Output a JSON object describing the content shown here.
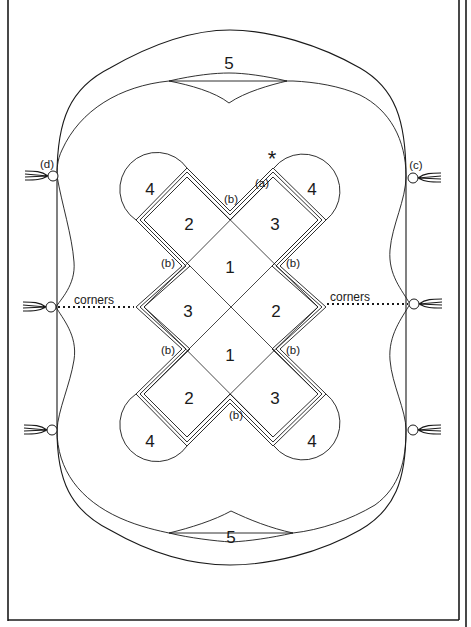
{
  "figure": {
    "type": "sewing/pattern layout diagram",
    "section_numbers": [
      {
        "id": "5-top",
        "text": "5",
        "x": 229,
        "y": 63
      },
      {
        "id": "5-bottom",
        "text": "5",
        "x": 231,
        "y": 537
      },
      {
        "id": "4-top-left",
        "text": "4",
        "x": 150,
        "y": 189
      },
      {
        "id": "4-top-right",
        "text": "4",
        "x": 312,
        "y": 189
      },
      {
        "id": "4-bottom-left",
        "text": "4",
        "x": 150,
        "y": 441
      },
      {
        "id": "4-bottom-right",
        "text": "4",
        "x": 312,
        "y": 441
      },
      {
        "id": "2-top-left",
        "text": "2",
        "x": 189,
        "y": 224
      },
      {
        "id": "3-top-right",
        "text": "3",
        "x": 275,
        "y": 224
      },
      {
        "id": "1-upper",
        "text": "1",
        "x": 230,
        "y": 267
      },
      {
        "id": "3-left",
        "text": "3",
        "x": 188,
        "y": 311
      },
      {
        "id": "2-right",
        "text": "2",
        "x": 276,
        "y": 311
      },
      {
        "id": "1-lower",
        "text": "1",
        "x": 230,
        "y": 355
      },
      {
        "id": "2-bottom-left",
        "text": "2",
        "x": 189,
        "y": 398
      },
      {
        "id": "3-bottom-right",
        "text": "3",
        "x": 275,
        "y": 398
      }
    ],
    "letter_labels": [
      {
        "id": "a",
        "text": "(a)",
        "x": 321,
        "y": 190
      },
      {
        "id": "b-top",
        "text": "(b)",
        "x": 232,
        "y": 208
      },
      {
        "id": "b-left-upper",
        "text": "(b)",
        "x": 166,
        "y": 266
      },
      {
        "id": "b-right-upper",
        "text": "(b)",
        "x": 295,
        "y": 266
      },
      {
        "id": "b-left-lower",
        "text": "(b)",
        "x": 166,
        "y": 354
      },
      {
        "id": "b-right-lower",
        "text": "(b)",
        "x": 295,
        "y": 354
      },
      {
        "id": "b-bottom",
        "text": "(b)",
        "x": 232,
        "y": 420
      },
      {
        "id": "c",
        "text": "(c)",
        "x": 408,
        "y": 168
      },
      {
        "id": "d",
        "text": "(d)",
        "x": 46,
        "y": 167
      }
    ],
    "asterisk": {
      "text": "*",
      "x": 272,
      "y": 162
    },
    "corner_labels": {
      "left": {
        "text": "corners",
        "x": 72,
        "y": 303
      },
      "right": {
        "text": "corners",
        "x": 331,
        "y": 303
      }
    },
    "tassels": [
      {
        "id": "tassel-top-left",
        "side": "left",
        "x": 53,
        "y": 176
      },
      {
        "id": "tassel-mid-left",
        "side": "left",
        "x": 51,
        "y": 307
      },
      {
        "id": "tassel-bottom-left",
        "side": "left",
        "x": 52,
        "y": 430
      },
      {
        "id": "tassel-top-right",
        "side": "right",
        "x": 413,
        "y": 178
      },
      {
        "id": "tassel-mid-right",
        "side": "right",
        "x": 414,
        "y": 304
      },
      {
        "id": "tassel-bottom-right",
        "side": "right",
        "x": 413,
        "y": 430
      }
    ],
    "colors": {
      "ink": "#1a1a1a",
      "paper": "#ffffff"
    }
  }
}
